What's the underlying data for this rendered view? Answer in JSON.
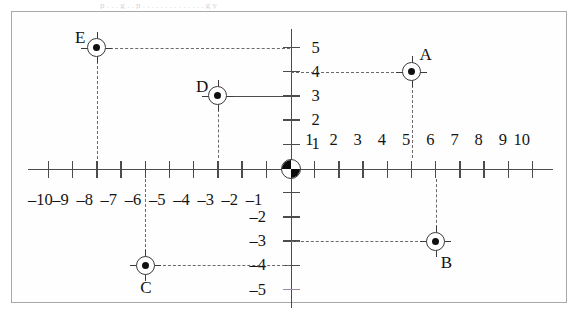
{
  "figure": {
    "top_sliver_text": "p . . . g . . p . . . . . . . . . . . . . . g y",
    "origin_label": "O",
    "colors": {
      "axis": "#4c4c4c",
      "guide": "#6a6a6a",
      "accent_tick": "#9d86a8",
      "frame": "#a9a9a9",
      "point": "#101010"
    }
  },
  "chart_data": {
    "type": "scatter",
    "title": "",
    "xlabel": "",
    "ylabel": "",
    "xlim": [
      -11,
      11
    ],
    "ylim": [
      -6,
      6
    ],
    "grid": false,
    "legend": "none",
    "x_ticks": [
      -10,
      -9,
      -8,
      -7,
      -6,
      -5,
      -4,
      -3,
      -2,
      -1,
      1,
      2,
      3,
      4,
      5,
      6,
      7,
      8,
      9,
      10
    ],
    "x_tick_labels": [
      "–10",
      "–9",
      "–8",
      "–7",
      "–6",
      "–5",
      "–4",
      "–3",
      "–2",
      "–1",
      "1",
      "2",
      "3",
      "4",
      "5",
      "6",
      "7",
      "8",
      "9",
      "10"
    ],
    "y_ticks": [
      5,
      4,
      3,
      2,
      1,
      -1,
      -2,
      -3,
      -4,
      -5
    ],
    "y_tick_labels": [
      "5",
      "4",
      "3",
      "2",
      "1",
      "",
      "–2",
      "–3",
      "–4",
      "–5"
    ],
    "accent_ticks": [
      -5
    ],
    "points": [
      {
        "label": "A",
        "x": 5,
        "y": 4,
        "guide_style": "dashed"
      },
      {
        "label": "B",
        "x": 6,
        "y": -3,
        "guide_style": "dashed"
      },
      {
        "label": "C",
        "x": -6,
        "y": -4,
        "guide_style": "dashed"
      },
      {
        "label": "D",
        "x": -3,
        "y": 3,
        "guide_style": "solid-horizontal"
      },
      {
        "label": "E",
        "x": -8,
        "y": 5,
        "guide_style": "dashed"
      }
    ]
  }
}
